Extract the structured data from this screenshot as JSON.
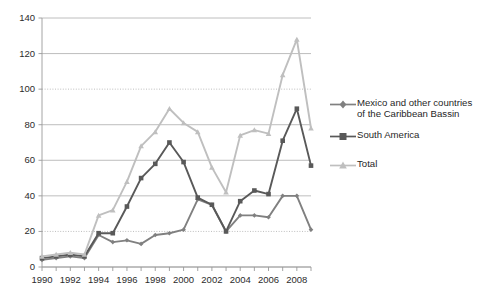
{
  "chart_data": {
    "type": "line",
    "title": "",
    "xlabel": "",
    "ylabel": "",
    "xlim": [
      1990,
      2009
    ],
    "ylim": [
      0,
      140
    ],
    "ytick_step": 20,
    "yticks": [
      0,
      20,
      40,
      60,
      80,
      100,
      120,
      140
    ],
    "xticks": [
      1990,
      1991,
      1992,
      1993,
      1994,
      1995,
      1996,
      1997,
      1998,
      1999,
      2000,
      2001,
      2002,
      2003,
      2004,
      2005,
      2006,
      2007,
      2008,
      2009
    ],
    "xtick_labels_shown": [
      "1990",
      "1992",
      "1994",
      "1996",
      "1998",
      "2000",
      "2002",
      "2004",
      "2006",
      "2008"
    ],
    "x": [
      1990,
      1991,
      1992,
      1993,
      1994,
      1995,
      1996,
      1997,
      1998,
      1999,
      2000,
      2001,
      2002,
      2003,
      2004,
      2005,
      2006,
      2007,
      2008,
      2009
    ],
    "grid": true,
    "legend_position": "right",
    "series": [
      {
        "name": "Mexico and other countries of the Caribbean Bassin",
        "marker": "diamond",
        "color": "#808080",
        "values": [
          4,
          5,
          6,
          5,
          18,
          14,
          15,
          13,
          18,
          19,
          21,
          38,
          35,
          20,
          29,
          29,
          28,
          40,
          40,
          21
        ]
      },
      {
        "name": "South America",
        "marker": "square",
        "color": "#595959",
        "values": [
          5,
          6,
          7,
          6,
          19,
          19,
          34,
          50,
          58,
          70,
          59,
          39,
          35,
          20,
          37,
          43,
          41,
          71,
          89,
          57
        ]
      },
      {
        "name": "Total",
        "marker": "triangle",
        "color": "#bfbfbf",
        "values": [
          6,
          7,
          8,
          7,
          29,
          32,
          48,
          68,
          76,
          89,
          81,
          76,
          56,
          42,
          74,
          77,
          75,
          108,
          128,
          78
        ]
      }
    ]
  },
  "legend": {
    "entries": [
      {
        "label_line1": "Mexico and other countries",
        "label_line2": "of the Caribbean Bassin"
      },
      {
        "label_line1": "South America",
        "label_line2": ""
      },
      {
        "label_line1": "Total",
        "label_line2": ""
      }
    ]
  },
  "colors": {
    "mexico": "#808080",
    "south_america": "#595959",
    "total": "#bfbfbf",
    "grid": "#b7b7b7",
    "axis": "#9a9a9a",
    "text": "#222222",
    "background": "#ffffff"
  }
}
